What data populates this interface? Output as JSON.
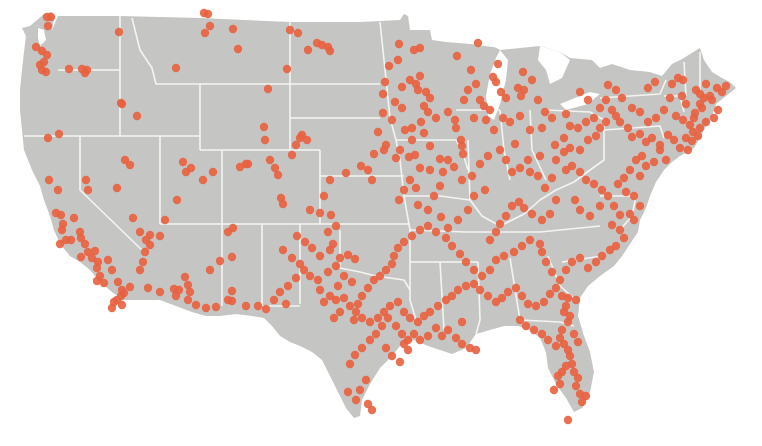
{
  "map": {
    "title": "",
    "region": "Contiguous United States",
    "land_color": "#c5c5c3",
    "border_color": "#f4f4f2",
    "dot_color": "#e8603f",
    "dot_opacity": 0.9,
    "dot_radius": 4.2
  },
  "points": [
    [
      47,
      17
    ],
    [
      51,
      17
    ],
    [
      48,
      26
    ],
    [
      36,
      47
    ],
    [
      42,
      51
    ],
    [
      47,
      55
    ],
    [
      44,
      62
    ],
    [
      40,
      65
    ],
    [
      42,
      70
    ],
    [
      46,
      72
    ],
    [
      69,
      69
    ],
    [
      82,
      69
    ],
    [
      85,
      73
    ],
    [
      87,
      70
    ],
    [
      119,
      32
    ],
    [
      176,
      68
    ],
    [
      121,
      103
    ],
    [
      137,
      116
    ],
    [
      122,
      104
    ],
    [
      59,
      134
    ],
    [
      204,
      13
    ],
    [
      208,
      14
    ],
    [
      210,
      26
    ],
    [
      205,
      33
    ],
    [
      233,
      29
    ],
    [
      238,
      49
    ],
    [
      317,
      43
    ],
    [
      322,
      45
    ],
    [
      328,
      47
    ],
    [
      330,
      51
    ],
    [
      308,
      50
    ],
    [
      290,
      30
    ],
    [
      298,
      33
    ],
    [
      287,
      69
    ],
    [
      268,
      89
    ],
    [
      264,
      127
    ],
    [
      265,
      140
    ],
    [
      48,
      138
    ],
    [
      49,
      180
    ],
    [
      58,
      190
    ],
    [
      56,
      213
    ],
    [
      61,
      215
    ],
    [
      63,
      224
    ],
    [
      66,
      240
    ],
    [
      71,
      240
    ],
    [
      60,
      244
    ],
    [
      62,
      230
    ],
    [
      74,
      218
    ],
    [
      80,
      232
    ],
    [
      81,
      238
    ],
    [
      85,
      244
    ],
    [
      88,
      252
    ],
    [
      81,
      257
    ],
    [
      95,
      251
    ],
    [
      108,
      260
    ],
    [
      112,
      270
    ],
    [
      118,
      282
    ],
    [
      122,
      290
    ],
    [
      130,
      287
    ],
    [
      117,
      300
    ],
    [
      121,
      296
    ],
    [
      92,
      258
    ],
    [
      98,
      262
    ],
    [
      97,
      268
    ],
    [
      100,
      276
    ],
    [
      97,
      281
    ],
    [
      104,
      283
    ],
    [
      114,
      302
    ],
    [
      122,
      305
    ],
    [
      140,
      270
    ],
    [
      143,
      262
    ],
    [
      145,
      252
    ],
    [
      146,
      240
    ],
    [
      150,
      235
    ],
    [
      124,
      293
    ],
    [
      112,
      308
    ],
    [
      86,
      180
    ],
    [
      88,
      190
    ],
    [
      125,
      160
    ],
    [
      130,
      165
    ],
    [
      117,
      188
    ],
    [
      133,
      218
    ],
    [
      140,
      232
    ],
    [
      150,
      245
    ],
    [
      160,
      236
    ],
    [
      148,
      288
    ],
    [
      160,
      292
    ],
    [
      183,
      162
    ],
    [
      191,
      168
    ],
    [
      186,
      172
    ],
    [
      177,
      200
    ],
    [
      165,
      220
    ],
    [
      203,
      180
    ],
    [
      213,
      172
    ],
    [
      246,
      164
    ],
    [
      240,
      167
    ],
    [
      248,
      164
    ],
    [
      270,
      160
    ],
    [
      275,
      168
    ],
    [
      278,
      175
    ],
    [
      281,
      198
    ],
    [
      283,
      204
    ],
    [
      296,
      145
    ],
    [
      185,
      277
    ],
    [
      188,
      285
    ],
    [
      190,
      292
    ],
    [
      188,
      300
    ],
    [
      196,
      305
    ],
    [
      206,
      308
    ],
    [
      216,
      307
    ],
    [
      228,
      300
    ],
    [
      232,
      301
    ],
    [
      246,
      306
    ],
    [
      258,
      306
    ],
    [
      266,
      309
    ],
    [
      174,
      289
    ],
    [
      179,
      290
    ],
    [
      176,
      296
    ],
    [
      228,
      232
    ],
    [
      233,
      228
    ],
    [
      210,
      270
    ],
    [
      220,
      261
    ],
    [
      232,
      291
    ],
    [
      232,
      257
    ],
    [
      302,
      135
    ],
    [
      300,
      138
    ],
    [
      307,
      140
    ],
    [
      292,
      155
    ],
    [
      310,
      210
    ],
    [
      320,
      213
    ],
    [
      324,
      196
    ],
    [
      330,
      180
    ],
    [
      346,
      173
    ],
    [
      331,
      215
    ],
    [
      333,
      244
    ],
    [
      330,
      250
    ],
    [
      340,
      258
    ],
    [
      348,
      255
    ],
    [
      355,
      259
    ],
    [
      361,
      166
    ],
    [
      368,
      170
    ],
    [
      372,
      180
    ],
    [
      374,
      154
    ],
    [
      384,
      150
    ],
    [
      378,
      132
    ],
    [
      386,
      145
    ],
    [
      383,
      113
    ],
    [
      383,
      94
    ],
    [
      385,
      82
    ],
    [
      389,
      66
    ],
    [
      399,
      44
    ],
    [
      398,
      60
    ],
    [
      414,
      50
    ],
    [
      420,
      48
    ],
    [
      402,
      87
    ],
    [
      410,
      80
    ],
    [
      416,
      84
    ],
    [
      420,
      76
    ],
    [
      418,
      90
    ],
    [
      426,
      92
    ],
    [
      430,
      98
    ],
    [
      424,
      106
    ],
    [
      428,
      112
    ],
    [
      421,
      122
    ],
    [
      412,
      128
    ],
    [
      402,
      108
    ],
    [
      395,
      102
    ],
    [
      392,
      120
    ],
    [
      405,
      130
    ],
    [
      412,
      140
    ],
    [
      400,
      150
    ],
    [
      396,
      158
    ],
    [
      456,
      128
    ],
    [
      461,
      140
    ],
    [
      462,
      146
    ],
    [
      463,
      154
    ],
    [
      455,
      120
    ],
    [
      448,
      112
    ],
    [
      436,
      118
    ],
    [
      424,
      133
    ],
    [
      430,
      146
    ],
    [
      448,
      160
    ],
    [
      443,
      172
    ],
    [
      440,
      186
    ],
    [
      434,
      196
    ],
    [
      416,
      188
    ],
    [
      410,
      180
    ],
    [
      404,
      190
    ],
    [
      399,
      200
    ],
    [
      409,
      157
    ],
    [
      415,
      155
    ],
    [
      420,
      168
    ],
    [
      430,
      170
    ],
    [
      440,
      159
    ],
    [
      454,
      167
    ],
    [
      462,
      180
    ],
    [
      472,
      176
    ],
    [
      480,
      164
    ],
    [
      485,
      190
    ],
    [
      474,
      196
    ],
    [
      468,
      210
    ],
    [
      458,
      220
    ],
    [
      448,
      228
    ],
    [
      441,
      217
    ],
    [
      428,
      210
    ],
    [
      418,
      205
    ],
    [
      457,
      56
    ],
    [
      478,
      43
    ],
    [
      498,
      64
    ],
    [
      493,
      77
    ],
    [
      496,
      82
    ],
    [
      501,
      92
    ],
    [
      506,
      98
    ],
    [
      490,
      110
    ],
    [
      486,
      120
    ],
    [
      494,
      130
    ],
    [
      503,
      118
    ],
    [
      510,
      122
    ],
    [
      520,
      116
    ],
    [
      530,
      130
    ],
    [
      515,
      144
    ],
    [
      500,
      150
    ],
    [
      488,
      156
    ],
    [
      471,
      70
    ],
    [
      476,
      84
    ],
    [
      468,
      90
    ],
    [
      464,
      100
    ],
    [
      480,
      100
    ],
    [
      484,
      106
    ],
    [
      474,
      118
    ],
    [
      518,
      88
    ],
    [
      521,
      96
    ],
    [
      523,
      72
    ],
    [
      524,
      90
    ],
    [
      532,
      80
    ],
    [
      538,
      100
    ],
    [
      545,
      112
    ],
    [
      542,
      128
    ],
    [
      552,
      118
    ],
    [
      506,
      160
    ],
    [
      512,
      172
    ],
    [
      520,
      168
    ],
    [
      528,
      160
    ],
    [
      530,
      172
    ],
    [
      538,
      176
    ],
    [
      545,
      188
    ],
    [
      552,
      178
    ],
    [
      540,
      156
    ],
    [
      556,
      160
    ],
    [
      564,
      152
    ],
    [
      570,
      148
    ],
    [
      580,
      150
    ],
    [
      588,
      140
    ],
    [
      596,
      136
    ],
    [
      600,
      128
    ],
    [
      606,
      122
    ],
    [
      612,
      110
    ],
    [
      616,
      116
    ],
    [
      620,
      122
    ],
    [
      628,
      128
    ],
    [
      632,
      137
    ],
    [
      640,
      134
    ],
    [
      646,
      142
    ],
    [
      652,
      138
    ],
    [
      660,
      145
    ],
    [
      668,
      135
    ],
    [
      674,
      140
    ],
    [
      680,
      148
    ],
    [
      688,
      150
    ],
    [
      692,
      141
    ],
    [
      698,
      136
    ],
    [
      676,
      116
    ],
    [
      683,
      120
    ],
    [
      690,
      125
    ],
    [
      695,
      113
    ],
    [
      702,
      108
    ],
    [
      686,
      104
    ],
    [
      682,
      96
    ],
    [
      670,
      98
    ],
    [
      664,
      110
    ],
    [
      656,
      118
    ],
    [
      648,
      122
    ],
    [
      640,
      112
    ],
    [
      632,
      108
    ],
    [
      622,
      98
    ],
    [
      616,
      90
    ],
    [
      608,
      85
    ],
    [
      606,
      100
    ],
    [
      600,
      108
    ],
    [
      594,
      118
    ],
    [
      586,
      122
    ],
    [
      578,
      128
    ],
    [
      570,
      126
    ],
    [
      564,
      138
    ],
    [
      555,
      145
    ],
    [
      580,
      92
    ],
    [
      588,
      100
    ],
    [
      566,
      114
    ],
    [
      648,
      88
    ],
    [
      655,
      82
    ],
    [
      672,
      84
    ],
    [
      678,
      78
    ],
    [
      683,
      80
    ],
    [
      696,
      90
    ],
    [
      700,
      94
    ],
    [
      706,
      84
    ],
    [
      717,
      88
    ],
    [
      722,
      92
    ],
    [
      726,
      86
    ],
    [
      712,
      100
    ],
    [
      718,
      110
    ],
    [
      714,
      118
    ],
    [
      706,
      122
    ],
    [
      700,
      128
    ],
    [
      693,
      132
    ],
    [
      686,
      138
    ],
    [
      694,
      118
    ],
    [
      700,
      104
    ],
    [
      704,
      98
    ],
    [
      710,
      96
    ],
    [
      660,
      150
    ],
    [
      666,
      160
    ],
    [
      654,
      162
    ],
    [
      642,
      156
    ],
    [
      636,
      160
    ],
    [
      646,
      166
    ],
    [
      640,
      176
    ],
    [
      630,
      170
    ],
    [
      624,
      178
    ],
    [
      618,
      184
    ],
    [
      626,
      192
    ],
    [
      634,
      196
    ],
    [
      640,
      206
    ],
    [
      630,
      214
    ],
    [
      634,
      220
    ],
    [
      620,
      215
    ],
    [
      614,
      206
    ],
    [
      608,
      196
    ],
    [
      602,
      190
    ],
    [
      594,
      184
    ],
    [
      586,
      180
    ],
    [
      580,
      172
    ],
    [
      572,
      166
    ],
    [
      566,
      170
    ],
    [
      556,
      200
    ],
    [
      550,
      214
    ],
    [
      542,
      220
    ],
    [
      532,
      214
    ],
    [
      524,
      208
    ],
    [
      519,
      202
    ],
    [
      512,
      206
    ],
    [
      506,
      216
    ],
    [
      500,
      224
    ],
    [
      496,
      232
    ],
    [
      490,
      240
    ],
    [
      575,
      200
    ],
    [
      580,
      210
    ],
    [
      590,
      216
    ],
    [
      600,
      206
    ],
    [
      612,
      225
    ],
    [
      620,
      230
    ],
    [
      624,
      238
    ],
    [
      616,
      246
    ],
    [
      610,
      250
    ],
    [
      602,
      256
    ],
    [
      596,
      262
    ],
    [
      588,
      268
    ],
    [
      580,
      258
    ],
    [
      572,
      262
    ],
    [
      566,
      270
    ],
    [
      560,
      280
    ],
    [
      552,
      272
    ],
    [
      546,
      262
    ],
    [
      542,
      252
    ],
    [
      540,
      244
    ],
    [
      530,
      240
    ],
    [
      522,
      246
    ],
    [
      514,
      252
    ],
    [
      504,
      256
    ],
    [
      496,
      260
    ],
    [
      490,
      270
    ],
    [
      482,
      276
    ],
    [
      474,
      270
    ],
    [
      466,
      262
    ],
    [
      460,
      254
    ],
    [
      452,
      246
    ],
    [
      446,
      238
    ],
    [
      436,
      232
    ],
    [
      428,
      226
    ],
    [
      420,
      230
    ],
    [
      412,
      236
    ],
    [
      404,
      242
    ],
    [
      398,
      248
    ],
    [
      394,
      256
    ],
    [
      392,
      264
    ],
    [
      386,
      270
    ],
    [
      380,
      276
    ],
    [
      374,
      280
    ],
    [
      368,
      288
    ],
    [
      362,
      296
    ],
    [
      358,
      304
    ],
    [
      356,
      312
    ],
    [
      354,
      320
    ],
    [
      362,
      318
    ],
    [
      370,
      322
    ],
    [
      378,
      318
    ],
    [
      384,
      312
    ],
    [
      390,
      306
    ],
    [
      398,
      302
    ],
    [
      404,
      312
    ],
    [
      410,
      318
    ],
    [
      418,
      322
    ],
    [
      424,
      316
    ],
    [
      430,
      312
    ],
    [
      438,
      306
    ],
    [
      446,
      300
    ],
    [
      452,
      296
    ],
    [
      458,
      290
    ],
    [
      466,
      286
    ],
    [
      474,
      284
    ],
    [
      480,
      290
    ],
    [
      488,
      296
    ],
    [
      496,
      302
    ],
    [
      502,
      298
    ],
    [
      508,
      292
    ],
    [
      516,
      288
    ],
    [
      522,
      296
    ],
    [
      528,
      304
    ],
    [
      536,
      306
    ],
    [
      544,
      302
    ],
    [
      550,
      294
    ],
    [
      556,
      288
    ],
    [
      562,
      296
    ],
    [
      566,
      306
    ],
    [
      570,
      316
    ],
    [
      520,
      320
    ],
    [
      526,
      326
    ],
    [
      534,
      330
    ],
    [
      542,
      334
    ],
    [
      548,
      340
    ],
    [
      556,
      346
    ],
    [
      560,
      338
    ],
    [
      564,
      344
    ],
    [
      568,
      350
    ],
    [
      570,
      356
    ],
    [
      572,
      364
    ],
    [
      574,
      372
    ],
    [
      578,
      378
    ],
    [
      576,
      386
    ],
    [
      580,
      394
    ],
    [
      582,
      402
    ],
    [
      566,
      366
    ],
    [
      562,
      372
    ],
    [
      558,
      376
    ],
    [
      560,
      384
    ],
    [
      554,
      390
    ],
    [
      578,
      342
    ],
    [
      574,
      334
    ],
    [
      562,
      330
    ],
    [
      568,
      322
    ],
    [
      564,
      312
    ],
    [
      568,
      298
    ],
    [
      576,
      300
    ],
    [
      568,
      420
    ],
    [
      586,
      396
    ],
    [
      356,
      400
    ],
    [
      348,
      392
    ],
    [
      360,
      390
    ],
    [
      372,
      410
    ],
    [
      368,
      404
    ],
    [
      366,
      380
    ],
    [
      350,
      364
    ],
    [
      355,
      355
    ],
    [
      362,
      348
    ],
    [
      370,
      340
    ],
    [
      376,
      334
    ],
    [
      382,
      326
    ],
    [
      388,
      318
    ],
    [
      396,
      326
    ],
    [
      402,
      334
    ],
    [
      408,
      340
    ],
    [
      386,
      348
    ],
    [
      392,
      356
    ],
    [
      400,
      362
    ],
    [
      408,
      350
    ],
    [
      404,
      344
    ],
    [
      414,
      334
    ],
    [
      420,
      340
    ],
    [
      428,
      336
    ],
    [
      436,
      328
    ],
    [
      442,
      336
    ],
    [
      448,
      330
    ],
    [
      456,
      338
    ],
    [
      462,
      344
    ],
    [
      470,
      348
    ],
    [
      476,
      350
    ],
    [
      462,
      322
    ],
    [
      324,
      302
    ],
    [
      330,
      296
    ],
    [
      336,
      300
    ],
    [
      344,
      298
    ],
    [
      350,
      306
    ],
    [
      340,
      312
    ],
    [
      334,
      318
    ],
    [
      320,
      290
    ],
    [
      318,
      280
    ],
    [
      328,
      272
    ],
    [
      336,
      266
    ],
    [
      344,
      276
    ],
    [
      352,
      282
    ],
    [
      338,
      286
    ],
    [
      283,
      250
    ],
    [
      292,
      258
    ],
    [
      300,
      264
    ],
    [
      304,
      270
    ],
    [
      310,
      276
    ],
    [
      296,
      278
    ],
    [
      288,
      286
    ],
    [
      280,
      292
    ],
    [
      274,
      300
    ],
    [
      286,
      304
    ],
    [
      297,
      236
    ],
    [
      305,
      242
    ],
    [
      312,
      248
    ],
    [
      320,
      256
    ],
    [
      328,
      232
    ],
    [
      336,
      226
    ]
  ]
}
